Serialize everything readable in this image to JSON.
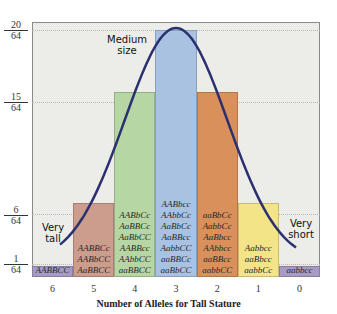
{
  "chart_data": {
    "type": "bar",
    "title": "",
    "xlabel": "Number of Alleles for Tall Stature",
    "ylabel": "",
    "categories": [
      "6",
      "5",
      "4",
      "3",
      "2",
      "1",
      "0"
    ],
    "values": [
      1,
      6,
      15,
      20,
      15,
      6,
      1
    ],
    "value_denominator": 64,
    "ylim": [
      0,
      20
    ],
    "yticks": [
      {
        "num": "20",
        "den": "64",
        "value": 20
      },
      {
        "num": "15",
        "den": "64",
        "value": 15
      },
      {
        "num": "6",
        "den": "64",
        "value": 6
      },
      {
        "num": "1",
        "den": "64",
        "value": 1
      }
    ],
    "bar_colors": [
      "#a79ac4",
      "#cc9c8c",
      "#b6d6a4",
      "#a9c2e2",
      "#d9905a",
      "#f4e488",
      "#a79ac4"
    ],
    "genotypes": [
      [
        "AABBCC"
      ],
      [
        "AABBCc",
        "AABbCC",
        "AaBBCC"
      ],
      [
        "AABbCc",
        "AaBBCc",
        "AaBbCC",
        "AABBcc",
        "AAbbCC",
        "aaBBCC"
      ],
      [
        "AABbcc",
        "AAbbCc",
        "AaBbCc",
        "AaBBcc",
        "AabbCC",
        "aaBBCc",
        "aaBbCC"
      ],
      [
        "aaBbCc",
        "AabbCc",
        "AaBbcc",
        "AAbbcc",
        "aaBBcc",
        "aabbCC"
      ],
      [
        "Aabbcc",
        "aaBbcc",
        "aabbCc"
      ],
      [
        "aabbcc"
      ]
    ],
    "annotations": [
      {
        "text": [
          "Medium",
          "size"
        ],
        "near": "3"
      },
      {
        "text": [
          "Very",
          "tall"
        ],
        "near": "6"
      },
      {
        "text": [
          "Very",
          "short"
        ],
        "near": "0"
      }
    ],
    "curve": "normal distribution overlay",
    "curve_color": "#2b3070",
    "grid": "dotted horizontal at tick values",
    "legend": "none"
  }
}
